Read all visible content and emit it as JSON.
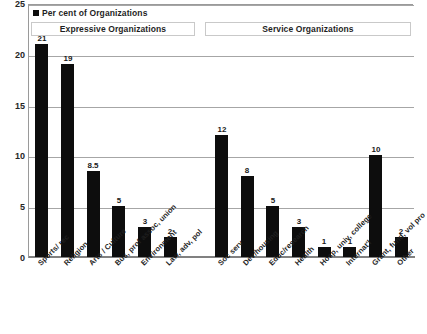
{
  "legend": {
    "swatch_color": "#0d0d0d",
    "label": "Per cent of Organizations"
  },
  "groups": [
    {
      "name": "expressive",
      "label": "Expressive Organizations"
    },
    {
      "name": "service",
      "label": "Service Organizations"
    }
  ],
  "chart_data": {
    "type": "bar",
    "title": "",
    "subtitle": "",
    "xlabel": "",
    "ylabel": "",
    "ylim": [
      0,
      25
    ],
    "ytick_labels": [
      "0",
      "5",
      "10",
      "15",
      "20",
      "25"
    ],
    "yticks": [
      0,
      5,
      10,
      15,
      20,
      25
    ],
    "grid": true,
    "legend_position": "top-left",
    "series": [
      {
        "name": "Per cent of Organizations",
        "color": "#0d0d0d",
        "values": [
          21,
          19,
          8.5,
          5,
          3,
          2,
          12,
          8,
          5,
          3,
          1,
          1,
          10,
          2
        ]
      }
    ],
    "categories": [
      "Sports/ rec",
      "Religion",
      "Arts / Culture",
      "Bus, prof assoc, union",
      "Environment",
      "Law, adv, pol",
      "Soc serv",
      "Dev/housing",
      "Educ/research",
      "Health",
      "Hosp, univ, college",
      "Internat'l",
      "Grant, fund, vol pro",
      "Other"
    ],
    "data_labels": [
      "21",
      "19",
      "8.5",
      "5",
      "3",
      "2",
      "12",
      "8",
      "5",
      "3",
      "1",
      "1",
      "10",
      "2"
    ],
    "group_assignment": [
      "Expressive Organizations",
      "Expressive Organizations",
      "Expressive Organizations",
      "Expressive Organizations",
      "Expressive Organizations",
      "Expressive Organizations",
      "Service Organizations",
      "Service Organizations",
      "Service Organizations",
      "Service Organizations",
      "Service Organizations",
      "Service Organizations",
      "Service Organizations",
      "Service Organizations"
    ]
  }
}
